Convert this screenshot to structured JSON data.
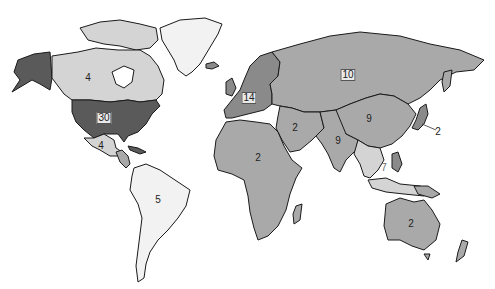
{
  "map": {
    "type": "choropleth-world-map",
    "colors": {
      "darkest": "#5a5a5a",
      "dark": "#8a8a8a",
      "medium": "#a9a9a9",
      "light": "#d4d4d4",
      "lightest": "#f2f2f2",
      "outline": "#1a1a1a"
    },
    "regions": [
      {
        "name": "United States",
        "value": "30",
        "shade": "darkest"
      },
      {
        "name": "Alaska",
        "value": "",
        "shade": "darkest"
      },
      {
        "name": "Canada",
        "value": "4",
        "shade": "light"
      },
      {
        "name": "Greenland",
        "value": "",
        "shade": "lightest"
      },
      {
        "name": "Mexico",
        "value": "4",
        "shade": "light"
      },
      {
        "name": "Central America",
        "value": "",
        "shade": "medium"
      },
      {
        "name": "South America",
        "value": "5",
        "shade": "lightest"
      },
      {
        "name": "Europe",
        "value": "14",
        "shade": "dark"
      },
      {
        "name": "Russia",
        "value": "10",
        "shade": "medium"
      },
      {
        "name": "Middle East",
        "value": "2",
        "shade": "medium"
      },
      {
        "name": "Africa",
        "value": "2",
        "shade": "medium"
      },
      {
        "name": "India",
        "value": "9",
        "shade": "medium"
      },
      {
        "name": "China",
        "value": "9",
        "shade": "medium"
      },
      {
        "name": "Japan",
        "value": "2",
        "shade": "dark"
      },
      {
        "name": "Southeast Asia",
        "value": "7",
        "shade": "light"
      },
      {
        "name": "Australia",
        "value": "2",
        "shade": "medium"
      }
    ]
  },
  "labels": {
    "us": "30",
    "canada": "4",
    "mexico": "4",
    "south_america": "5",
    "europe": "14",
    "russia": "10",
    "middle_east": "2",
    "africa": "2",
    "india": "9",
    "china": "9",
    "japan": "2",
    "southeast_asia": "7",
    "australia": "2"
  }
}
